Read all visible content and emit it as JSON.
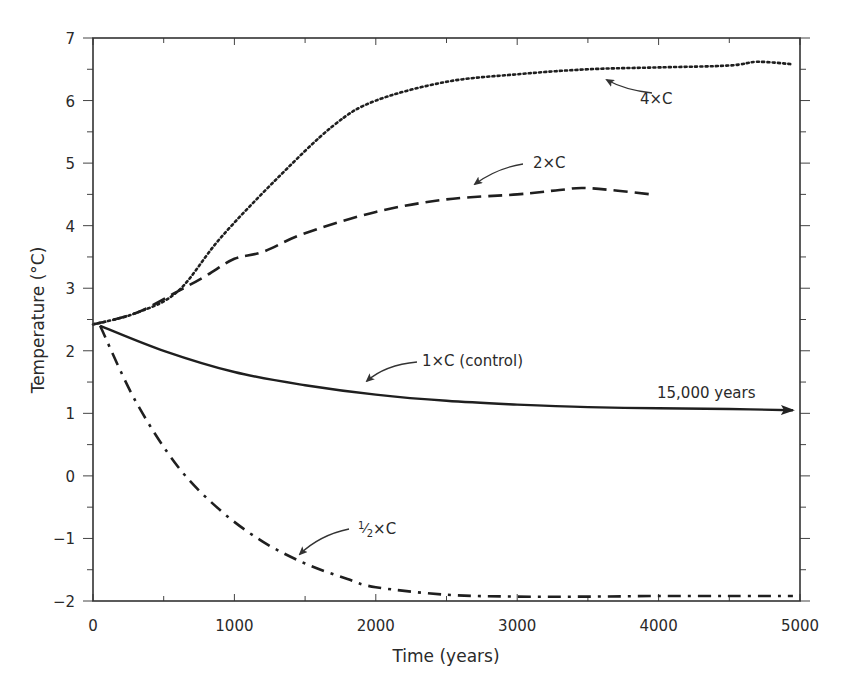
{
  "chart_data": {
    "type": "line",
    "title": "",
    "xlabel": "Time (years)",
    "ylabel": "Temperature (°C)",
    "xlim": [
      0,
      5000
    ],
    "ylim": [
      -2,
      7
    ],
    "grid": false,
    "legend": "none (inline annotations with arrows)",
    "x_ticks": [
      0,
      1000,
      2000,
      3000,
      4000,
      5000
    ],
    "x_minor_step": 500,
    "y_ticks": [
      -2,
      -1,
      0,
      1,
      2,
      3,
      4,
      5,
      6,
      7
    ],
    "y_minor_step": 0.5,
    "series": [
      {
        "name": "4×C",
        "style": "dotted",
        "x": [
          0,
          300,
          600,
          900,
          1300,
          1700,
          2000,
          2500,
          3000,
          3500,
          4000,
          4500,
          4700,
          4950
        ],
        "values": [
          2.42,
          2.6,
          2.95,
          3.8,
          4.75,
          5.6,
          6.0,
          6.3,
          6.42,
          6.5,
          6.53,
          6.56,
          6.62,
          6.58
        ]
      },
      {
        "name": "2×C",
        "style": "dashed",
        "x": [
          0,
          300,
          600,
          800,
          1000,
          1200,
          1500,
          2000,
          2500,
          3000,
          3300,
          3500,
          3950
        ],
        "values": [
          2.42,
          2.6,
          2.95,
          3.2,
          3.47,
          3.58,
          3.88,
          4.22,
          4.42,
          4.5,
          4.57,
          4.6,
          4.5
        ]
      },
      {
        "name": "1×C (control)",
        "style": "solid",
        "x": [
          50,
          500,
          1000,
          1500,
          2000,
          2500,
          3000,
          3500,
          4000,
          4500,
          4950
        ],
        "values": [
          2.4,
          2.0,
          1.66,
          1.45,
          1.3,
          1.2,
          1.14,
          1.1,
          1.08,
          1.07,
          1.05
        ]
      },
      {
        "name": "½×C",
        "style": "dash-dot",
        "x": [
          50,
          300,
          600,
          900,
          1200,
          1500,
          1800,
          2000,
          2500,
          3000,
          3500,
          4000,
          4500,
          4950
        ],
        "values": [
          2.4,
          1.2,
          0.15,
          -0.55,
          -1.05,
          -1.4,
          -1.65,
          -1.78,
          -1.9,
          -1.93,
          -1.93,
          -1.92,
          -1.92,
          -1.92
        ]
      }
    ],
    "annotations": [
      {
        "text": "4×C",
        "x": 4350,
        "y": 6.1,
        "arrow_to": [
          3600,
          6.42
        ]
      },
      {
        "text": "2×C",
        "x": 3400,
        "y": 5.0,
        "arrow_to": [
          2700,
          4.75
        ]
      },
      {
        "text": "1×C (control)",
        "x": 3450,
        "y": 1.8,
        "arrow_to": [
          2650,
          1.58
        ]
      },
      {
        "text": "15,000 years",
        "x": 4090,
        "y": 1.25,
        "note": "arrow on control curve extends off axis"
      },
      {
        "text": "½×C",
        "x": 3280,
        "y": -0.75,
        "arrow_to": [
          2880,
          -1.2
        ]
      }
    ]
  },
  "labels": {
    "xlabel": "Time (years)",
    "ylabel": "Temperature (°C)",
    "ann_4x": "4×C",
    "ann_2x": "2×C",
    "ann_1x": "1×C (control)",
    "ann_15000": "15,000 years",
    "ann_half": "×C"
  }
}
